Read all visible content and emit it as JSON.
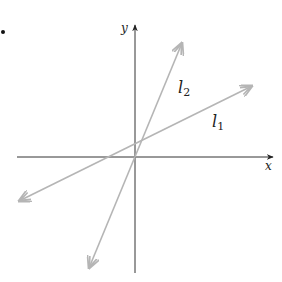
{
  "diagram": {
    "axes": {
      "x_label": "x",
      "y_label": "y"
    },
    "lines": [
      {
        "name": "l1",
        "label": "l",
        "subscript": "1",
        "color": "#b5b5b5"
      },
      {
        "name": "l2",
        "label": "l",
        "subscript": "2",
        "color": "#b5b5b5"
      }
    ],
    "bullet": "•"
  }
}
